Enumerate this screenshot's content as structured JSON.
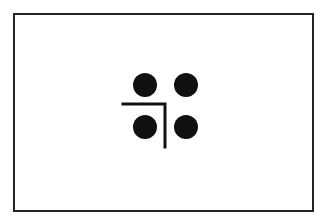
{
  "diagram": {
    "type": "symbol",
    "colors": {
      "border": "#222222",
      "ink": "#111111",
      "background": "#ffffff"
    },
    "dots": [
      {
        "id": "top-left",
        "cx": 145,
        "cy": 85,
        "r": 12
      },
      {
        "id": "top-right",
        "cx": 186,
        "cy": 85,
        "r": 12
      },
      {
        "id": "bottom-left",
        "cx": 145,
        "cy": 127,
        "r": 12
      },
      {
        "id": "bottom-right",
        "cx": 186,
        "cy": 127,
        "r": 12
      }
    ],
    "corner_line": {
      "horizontal": {
        "x1": 123,
        "y1": 104,
        "x2": 166,
        "y2": 104
      },
      "vertical": {
        "x1": 165,
        "y1": 104,
        "x2": 165,
        "y2": 147
      },
      "stroke_width": 3
    }
  }
}
